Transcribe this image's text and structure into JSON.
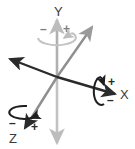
{
  "diagram": {
    "background_color": "#ffffff",
    "colors": {
      "dark_axis": "#2b2b2b",
      "gray_axis": "#b5b5b5",
      "gray_axis_mid": "#8f8f8f",
      "dark_rotation": "#1f1f1f",
      "gray_rotation": "#bdbdbd",
      "label_color": "#3a3a3a"
    },
    "origin": {
      "x": 57,
      "y": 77
    },
    "axes": [
      {
        "id": "y-axis",
        "label": "Y",
        "label_position": {
          "x": 58,
          "y": 12
        },
        "color": "#b5b5b5",
        "direction": "vertical",
        "positive_arrow": "up",
        "negative_arrow": "down"
      },
      {
        "id": "x-axis",
        "label": "X",
        "label_position": {
          "x": 124,
          "y": 99
        },
        "color": "#2b2b2b",
        "direction": "diagonal-shallow",
        "positive_arrow": "lower-right",
        "negative_arrow": "upper-left"
      },
      {
        "id": "z-axis",
        "label": "Z",
        "label_position": {
          "x": 14,
          "y": 139
        },
        "color": "#8f8f8f",
        "direction": "diagonal-steep",
        "positive_arrow": "lower-left",
        "negative_arrow": "upper-right"
      }
    ],
    "rotations": [
      {
        "id": "y-rotation",
        "axis": "Y",
        "color": "#bdbdbd",
        "ellipse_center": {
          "x": 57,
          "y": 38
        },
        "ellipse_rx": 19,
        "ellipse_ry": 7,
        "minus_sign": "–",
        "minus_position": {
          "x": 44,
          "y": 29
        },
        "plus_sign": "+",
        "plus_position": {
          "x": 66,
          "y": 29
        }
      },
      {
        "id": "x-rotation",
        "axis": "X",
        "color": "#1f1f1f",
        "ellipse_center": {
          "x": 101,
          "y": 90
        },
        "ellipse_rx": 7,
        "ellipse_ry": 14,
        "plus_sign": "+",
        "plus_position": {
          "x": 112,
          "y": 83
        },
        "minus_sign": "–",
        "minus_position": {
          "x": 111,
          "y": 101
        }
      },
      {
        "id": "z-rotation",
        "axis": "Z",
        "color": "#1f1f1f",
        "ellipse_center": {
          "x": 25,
          "y": 112
        },
        "ellipse_rx": 15,
        "ellipse_ry": 6,
        "minus_sign": "–",
        "minus_position": {
          "x": 13,
          "y": 124
        },
        "plus_sign": "+",
        "plus_position": {
          "x": 34,
          "y": 127
        }
      }
    ]
  }
}
